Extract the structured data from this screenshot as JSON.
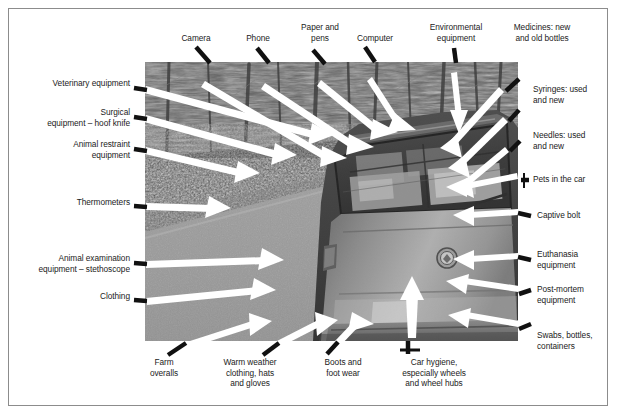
{
  "figure": {
    "type": "annotated-photograph",
    "photo": {
      "alt": "Black and white photograph of the rear of a hatchback estate car parked on a gravel track beside trees, boot loaded with boxes and containers",
      "palette": {
        "sky_trees": "#5f5f5f",
        "grass_bank": "#4a4a4a",
        "gravel_track": "#9a9a9a",
        "car_body": "#8f8f8f",
        "car_glass": "#3e3e3e",
        "arrow_white": "#ffffff",
        "leader_black": "#111111"
      }
    }
  },
  "labels": {
    "top": [
      {
        "id": "camera",
        "text": "Camera"
      },
      {
        "id": "phone",
        "text": "Phone"
      },
      {
        "id": "paper-and-pens",
        "text": "Paper and\npens"
      },
      {
        "id": "computer",
        "text": "Computer"
      },
      {
        "id": "environmental-equipment",
        "text": "Environmental\nequipment"
      },
      {
        "id": "medicines",
        "text": "Medicines: new\nand old bottles"
      }
    ],
    "left": [
      {
        "id": "veterinary-equipment",
        "text": "Veterinary equipment"
      },
      {
        "id": "surgical-equipment",
        "text": "Surgical\nequipment – hoof knife"
      },
      {
        "id": "animal-restraint-equipment",
        "text": "Animal restraint\nequipment"
      },
      {
        "id": "thermometers",
        "text": "Thermometers"
      },
      {
        "id": "animal-examination-equipment",
        "text": "Animal examination\nequipment – stethoscope"
      },
      {
        "id": "clothing",
        "text": "Clothing"
      }
    ],
    "right": [
      {
        "id": "syringes",
        "text": "Syringes: used\nand new"
      },
      {
        "id": "needles",
        "text": "Needles: used\nand new"
      },
      {
        "id": "pets-in-the-car",
        "text": "Pets in the car"
      },
      {
        "id": "captive-bolt",
        "text": "Captive bolt"
      },
      {
        "id": "euthanasia-equipment",
        "text": "Euthanasia\nequipment"
      },
      {
        "id": "post-mortem-equipment",
        "text": "Post-mortem\nequipment"
      },
      {
        "id": "swabs-bottles-containers",
        "text": "Swabs, bottles,\ncontainers"
      }
    ],
    "bottom": [
      {
        "id": "farm-overalls",
        "text": "Farm\noveralls"
      },
      {
        "id": "warm-weather-clothing",
        "text": "Warm weather\nclothing, hats\nand gloves"
      },
      {
        "id": "boots-and-foot-wear",
        "text": "Boots and\nfoot wear"
      },
      {
        "id": "car-hygiene",
        "text": "Car hygiene,\nespecially wheels\nand wheel hubs"
      }
    ]
  }
}
